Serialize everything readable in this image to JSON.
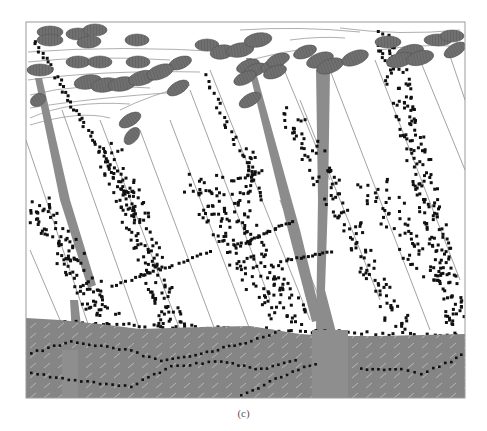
{
  "figure": {
    "caption": "(c)"
  },
  "colors": {
    "background": "#ffffff",
    "frame": "#9a9a9a",
    "ellipse_fill": "#6e6e6e",
    "ellipse_stroke": "#555555",
    "stem": "#8c8c8c",
    "substrate": "#858585",
    "substrate_hatch": "#b8b8b8",
    "dot": "#111111",
    "line": "#8a8a8a"
  },
  "frame": {
    "x": 26,
    "y": 22,
    "width": 439,
    "height": 376
  },
  "substrate": {
    "surface": [
      [
        26,
        318
      ],
      [
        60,
        320
      ],
      [
        100,
        324
      ],
      [
        140,
        329
      ],
      [
        200,
        327
      ],
      [
        250,
        326
      ],
      [
        300,
        334
      ],
      [
        330,
        336
      ],
      [
        380,
        336
      ],
      [
        465,
        334
      ]
    ],
    "bottom": 398
  }
}
